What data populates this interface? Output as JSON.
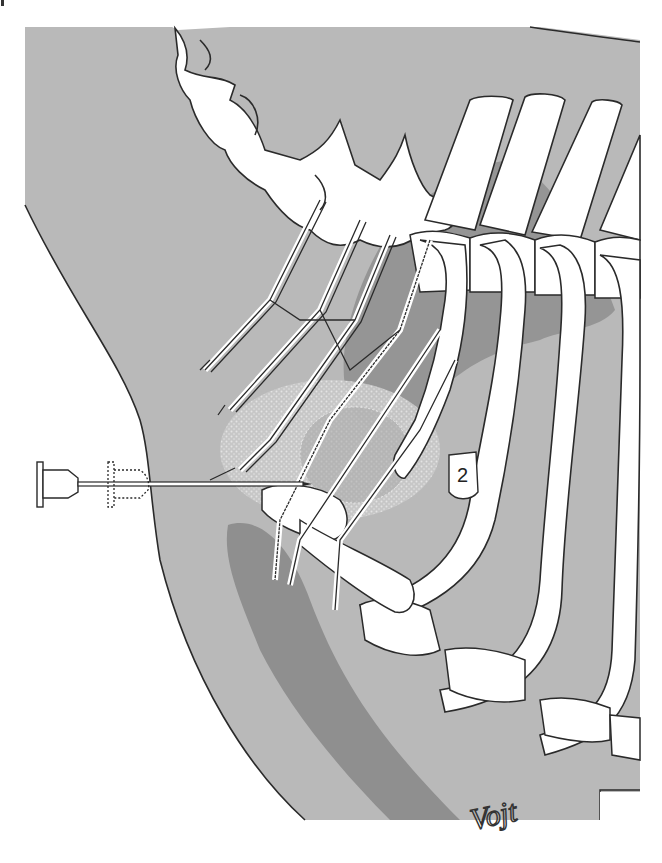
{
  "figure": {
    "rib_label": "2",
    "signature": "Vojt",
    "colors": {
      "skin_region": "#b9b9b9",
      "muscle_dark": "#8f8f8f",
      "muscle_mid": "#a3a3a3",
      "bone_fill": "#ffffff",
      "outline": "#2a2a2a",
      "background": "#ffffff"
    },
    "elements": {
      "needle": "spinal needle inserted horizontally from left",
      "needle_hub_dashed": "alternate needle hub position (dotted outline)",
      "injection_area": "stippled spread area of local anaesthetic around nerve roots",
      "vertebrae": "cervical and thoracic vertebral column (top)",
      "ribs": "ribs with costal cartilages (right)",
      "first_rib": "first rib with label 2 on second rib",
      "nerves": "brachial plexus nerve branches"
    }
  }
}
